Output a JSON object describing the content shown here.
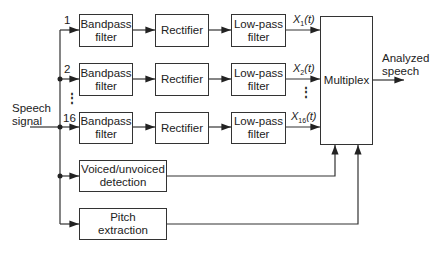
{
  "diagram": {
    "input_label": "Speech signal",
    "input_label_lines": [
      "Speech",
      "signal"
    ],
    "output_label_lines": [
      "Analyzed",
      "speech"
    ],
    "channels": [
      {
        "number": "1",
        "bandpass": [
          "Bandpass",
          "filter"
        ],
        "rectifier": "Rectifier",
        "lowpass": [
          "Low-pass",
          "filter"
        ],
        "output_signal": "X",
        "output_sub": "1",
        "output_arg": "(t)"
      },
      {
        "number": "2",
        "bandpass": [
          "Bandpass",
          "filter"
        ],
        "rectifier": "Rectifier",
        "lowpass": [
          "Low-pass",
          "filter"
        ],
        "output_signal": "X",
        "output_sub": "2",
        "output_arg": "(t)"
      },
      {
        "number": "16",
        "bandpass": [
          "Bandpass",
          "filter"
        ],
        "rectifier": "Rectifier",
        "lowpass": [
          "Low-pass",
          "filter"
        ],
        "output_signal": "X",
        "output_sub": "16",
        "output_arg": "(t)"
      }
    ],
    "ellipsis": "⋮",
    "multiplex": "Multiplex",
    "voiced_detection": [
      "Voiced/unvoiced",
      "detection"
    ],
    "pitch_extraction": [
      "Pitch",
      "extraction"
    ]
  }
}
